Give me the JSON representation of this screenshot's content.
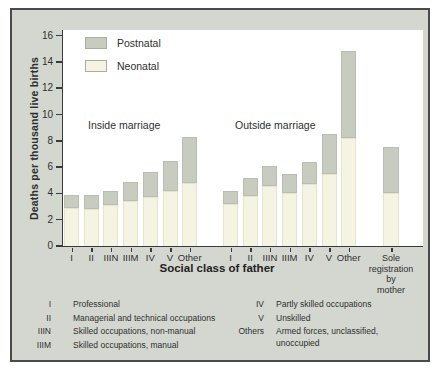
{
  "chart_data": {
    "type": "bar",
    "stacked": true,
    "title": "",
    "ylabel": "Deaths per thousand live births",
    "xlabel": "Social class of father",
    "ylim": [
      0,
      16
    ],
    "yticks": [
      0,
      2,
      4,
      6,
      8,
      10,
      12,
      14,
      16
    ],
    "grid": false,
    "legend_position": "top-left-inside",
    "legend": [
      {
        "name": "Postnatal",
        "color": "#c8ccc0"
      },
      {
        "name": "Neonatal",
        "color": "#f5f3e2"
      }
    ],
    "groups": [
      {
        "label": "Inside marriage",
        "categories": [
          "I",
          "II",
          "IIIN",
          "IIIM",
          "IV",
          "V",
          "Other"
        ],
        "series": [
          {
            "name": "Neonatal",
            "values": [
              2.9,
              2.8,
              3.1,
              3.4,
              3.7,
              4.2,
              4.8
            ]
          },
          {
            "name": "Postnatal",
            "values": [
              1.0,
              1.1,
              1.1,
              1.5,
              1.9,
              2.3,
              3.5
            ]
          }
        ],
        "totals": [
          3.9,
          3.9,
          4.2,
          4.9,
          5.6,
          6.5,
          8.3
        ]
      },
      {
        "label": "Outside marriage",
        "categories": [
          "I",
          "II",
          "IIIN",
          "IIIM",
          "IV",
          "V",
          "Other"
        ],
        "series": [
          {
            "name": "Neonatal",
            "values": [
              3.2,
              3.8,
              4.6,
              4.0,
              4.7,
              5.5,
              8.2
            ]
          },
          {
            "name": "Postnatal",
            "values": [
              1.0,
              1.4,
              1.5,
              1.5,
              1.7,
              3.0,
              6.6
            ]
          }
        ],
        "totals": [
          4.2,
          5.2,
          6.1,
          5.5,
          6.4,
          8.5,
          14.8
        ]
      },
      {
        "label": "",
        "categories": [
          "Sole registration by mother"
        ],
        "series": [
          {
            "name": "Neonatal",
            "values": [
              4.0
            ]
          },
          {
            "name": "Postnatal",
            "values": [
              3.5
            ]
          }
        ],
        "totals": [
          7.5
        ]
      }
    ],
    "footnotes": [
      {
        "term": "I",
        "definition": "Professional"
      },
      {
        "term": "II",
        "definition": "Managerial and technical occupations"
      },
      {
        "term": "IIIN",
        "definition": "Skilled occupations, non-manual"
      },
      {
        "term": "IIIM",
        "definition": "Skilled occupations, manual"
      },
      {
        "term": "IV",
        "definition": "Partly skilled occupations"
      },
      {
        "term": "V",
        "definition": "Unskilled"
      },
      {
        "term": "Others",
        "definition": "Armed forces, unclassified, unoccupied"
      }
    ]
  }
}
